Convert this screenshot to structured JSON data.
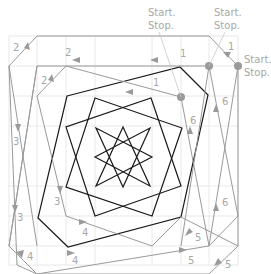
{
  "diagram": {
    "colors": {
      "grid": "#e6e6e6",
      "gray_path": "#9a9a9a",
      "black_path": "#1a1a1a",
      "label": "#a8a8a8",
      "dot": "#9a9a9a"
    },
    "start_stop_labels": [
      {
        "text_top": "Start.",
        "text_bottom": "Stop.",
        "x": 148,
        "y": 16
      },
      {
        "text_top": "Start.",
        "text_bottom": "Stop.",
        "x": 214,
        "y": 16
      },
      {
        "text_top": "Start.",
        "text_bottom": "Stop.",
        "x": 244,
        "y": 63
      }
    ],
    "segment_labels": [
      {
        "text": "1",
        "x": 228,
        "y": 50
      },
      {
        "text": "1",
        "x": 180,
        "y": 57
      },
      {
        "text": "1",
        "x": 153,
        "y": 86
      },
      {
        "text": "2",
        "x": 13,
        "y": 51
      },
      {
        "text": "2",
        "x": 65,
        "y": 56
      },
      {
        "text": "2",
        "x": 41,
        "y": 84
      },
      {
        "text": "3",
        "x": 13,
        "y": 145
      },
      {
        "text": "3",
        "x": 54,
        "y": 205
      },
      {
        "text": "3",
        "x": 17,
        "y": 221
      },
      {
        "text": "4",
        "x": 82,
        "y": 236
      },
      {
        "text": "4",
        "x": 27,
        "y": 260
      },
      {
        "text": "4",
        "x": 72,
        "y": 264
      },
      {
        "text": "5",
        "x": 195,
        "y": 241
      },
      {
        "text": "5",
        "x": 188,
        "y": 264
      },
      {
        "text": "5",
        "x": 225,
        "y": 268
      },
      {
        "text": "6",
        "x": 222,
        "y": 105
      },
      {
        "text": "6",
        "x": 190,
        "y": 124
      },
      {
        "text": "6",
        "x": 222,
        "y": 206
      }
    ],
    "start_points": [
      {
        "x": 209,
        "y": 66
      },
      {
        "x": 238,
        "y": 66
      },
      {
        "x": 181,
        "y": 97
      }
    ]
  }
}
